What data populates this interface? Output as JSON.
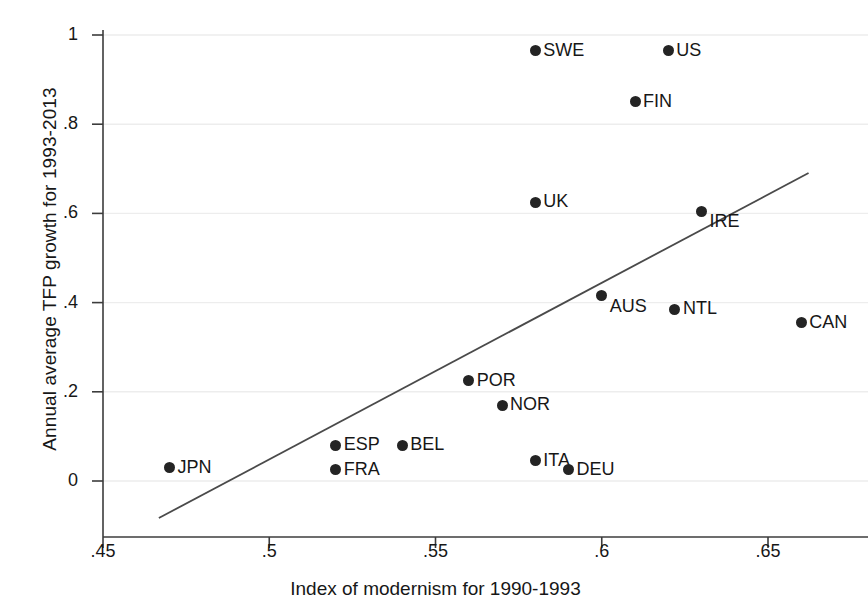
{
  "chart_data": {
    "type": "scatter",
    "title": "",
    "xlabel": "Index of modernism for 1990-1993",
    "ylabel": "Annual average TFP growth for 1993-2013",
    "xlim": [
      0.4475,
      0.6675
    ],
    "ylim": [
      -0.075,
      1.04
    ],
    "xticks": [
      0.45,
      0.5,
      0.55,
      0.6,
      0.65
    ],
    "xticklabels": [
      ".45",
      ".5",
      ".55",
      ".6",
      ".65"
    ],
    "yticks": [
      0,
      0.2,
      0.4,
      0.6,
      0.8,
      1
    ],
    "yticklabels": [
      "0",
      ".2",
      ".4",
      ".6",
      ".8",
      "1"
    ],
    "grid": "horizontal",
    "legend": "none",
    "marker_color": "#242424",
    "line_color": "#4a4a4a",
    "points": [
      {
        "label": "JPN",
        "x": 0.47,
        "y": 0.03,
        "label_pos": "right"
      },
      {
        "label": "ESP",
        "x": 0.52,
        "y": 0.08,
        "label_pos": "right"
      },
      {
        "label": "FRA",
        "x": 0.52,
        "y": 0.025,
        "label_pos": "right"
      },
      {
        "label": "BEL",
        "x": 0.54,
        "y": 0.08,
        "label_pos": "right"
      },
      {
        "label": "POR",
        "x": 0.56,
        "y": 0.225,
        "label_pos": "right"
      },
      {
        "label": "NOR",
        "x": 0.57,
        "y": 0.17,
        "label_pos": "right"
      },
      {
        "label": "SWE",
        "x": 0.58,
        "y": 0.965,
        "label_pos": "right"
      },
      {
        "label": "UK",
        "x": 0.58,
        "y": 0.625,
        "label_pos": "right"
      },
      {
        "label": "ITA",
        "x": 0.58,
        "y": 0.045,
        "label_pos": "right"
      },
      {
        "label": "DEU",
        "x": 0.59,
        "y": 0.025,
        "label_pos": "right"
      },
      {
        "label": "AUS",
        "x": 0.6,
        "y": 0.415,
        "label_pos": "below"
      },
      {
        "label": "FIN",
        "x": 0.61,
        "y": 0.85,
        "label_pos": "right"
      },
      {
        "label": "US",
        "x": 0.62,
        "y": 0.965,
        "label_pos": "right"
      },
      {
        "label": "NTL",
        "x": 0.622,
        "y": 0.385,
        "label_pos": "right"
      },
      {
        "label": "IRE",
        "x": 0.63,
        "y": 0.605,
        "label_pos": "below"
      },
      {
        "label": "CAN",
        "x": 0.66,
        "y": 0.355,
        "label_pos": "right"
      }
    ],
    "fit_line": {
      "name": "linear fit",
      "x_start": 0.4668,
      "y_start": -0.083,
      "x_end": 0.6622,
      "y_end": 0.6906
    }
  }
}
